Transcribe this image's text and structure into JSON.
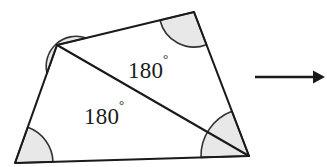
{
  "figure": {
    "name": "quadrilateral-angle-sum-diagram",
    "background_color": "#ffffff",
    "stroke_color": "#1a1a1a",
    "arc_fill_color": "#e8e8e8",
    "arc_stroke_color": "#333333",
    "quadrilateral": {
      "vertices": [
        {
          "name": "top-left",
          "x": 57,
          "y": 45
        },
        {
          "name": "top-right",
          "x": 194,
          "y": 12
        },
        {
          "name": "bottom-right",
          "x": 249,
          "y": 156
        },
        {
          "name": "bottom-left",
          "x": 15,
          "y": 163
        }
      ],
      "diagonal": {
        "from": "top-left",
        "to": "bottom-right"
      }
    },
    "angle_arcs": [
      {
        "vertex": "top-left",
        "radius": 30
      },
      {
        "vertex": "top-right",
        "radius": 35
      },
      {
        "vertex": "bottom-right",
        "radius": 48
      },
      {
        "vertex": "bottom-left",
        "radius": 38
      }
    ],
    "labels": [
      {
        "name": "upper-triangle-angle-sum",
        "value": "180",
        "unit": "°",
        "x": 128,
        "y": 78
      },
      {
        "name": "lower-triangle-angle-sum",
        "value": "180",
        "unit": "°",
        "x": 84,
        "y": 124
      }
    ],
    "arrow": {
      "name": "implies-arrow",
      "x1": 255,
      "y1": 77,
      "x2": 325,
      "y2": 77
    }
  }
}
